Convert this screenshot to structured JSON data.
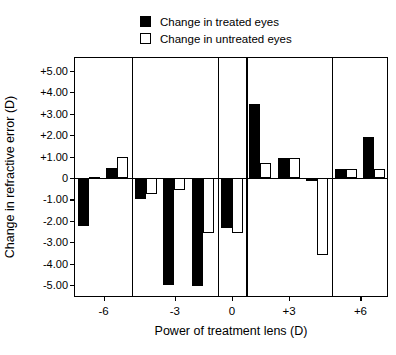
{
  "legend": {
    "items": [
      {
        "label": "Change in treated eyes",
        "swatch": "filled-square-icon"
      },
      {
        "label": "Change in untreated eyes",
        "swatch": "open-square-icon"
      }
    ]
  },
  "axes": {
    "ylabel": "Change in refractive error (D)",
    "xlabel": "Power of treatment lens (D)",
    "yticks": [
      "+5.00",
      "+4.00",
      "+3.00",
      "+2.00",
      "+1.00",
      "0",
      "-1.00",
      "-2.00",
      "-3.00",
      "-4.00",
      "-5.00"
    ],
    "ytick_values": [
      5,
      4,
      3,
      2,
      1,
      0,
      -1,
      -2,
      -3,
      -4,
      -5
    ],
    "xticks": [
      "-6",
      "-3",
      "0",
      "+3",
      "+6"
    ]
  },
  "chart_data": {
    "type": "bar",
    "title": "",
    "xlabel": "Power of treatment lens (D)",
    "ylabel": "Change in refractive error (D)",
    "ylim": [
      -5.6,
      5.6
    ],
    "grid": false,
    "legend_position": "top-center",
    "categories": [
      "-6",
      "-3",
      "0",
      "+3",
      "+6"
    ],
    "series": [
      {
        "name": "Change in treated eyes",
        "fill": "#000000"
      },
      {
        "name": "Change in untreated eyes",
        "fill": "#ffffff"
      }
    ],
    "groups": [
      {
        "category": "-6",
        "subjects": [
          {
            "treated": -2.25,
            "untreated": 0.07
          },
          {
            "treated": 0.47,
            "untreated": 0.97
          }
        ]
      },
      {
        "category": "-3",
        "subjects": [
          {
            "treated": -0.97,
            "untreated": -0.75
          },
          {
            "treated": -5.0,
            "untreated": -0.55
          },
          {
            "treated": -5.05,
            "untreated": -2.55
          }
        ]
      },
      {
        "category": "0",
        "subjects": [
          {
            "treated": -2.35,
            "untreated": -2.55
          }
        ]
      },
      {
        "category": "+3",
        "subjects": [
          {
            "treated": 3.45,
            "untreated": 0.68
          },
          {
            "treated": 0.95,
            "untreated": 0.93
          },
          {
            "treated": -0.12,
            "untreated": -3.6
          }
        ]
      },
      {
        "category": "+6",
        "subjects": [
          {
            "treated": 0.42,
            "untreated": 0.42
          },
          {
            "treated": 1.9,
            "untreated": 0.42
          }
        ]
      }
    ]
  },
  "colors": {
    "treated": "#000000",
    "untreated": "#ffffff",
    "axis": "#000000",
    "background": "#ffffff"
  }
}
